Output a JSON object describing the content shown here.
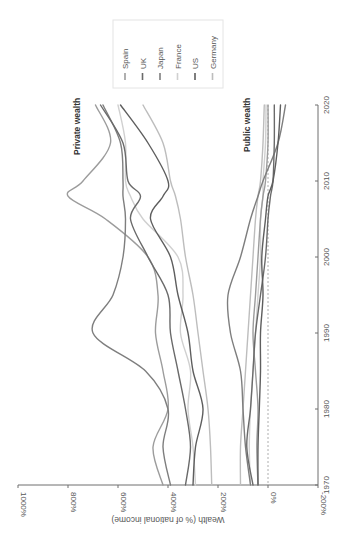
{
  "chart_data": {
    "type": "line",
    "orientation": "rotated-90-clockwise",
    "title": "",
    "xlabel": "",
    "ylabel": "Wealth (% of national income)",
    "x_ticks": [
      "1970",
      "1980",
      "1990",
      "2000",
      "2010",
      "2020"
    ],
    "y_ticks": [
      "-200%",
      "0%",
      "200%",
      "400%",
      "600%",
      "800%",
      "1000%"
    ],
    "xlim": [
      1970,
      2020
    ],
    "ylim": [
      -200,
      1000
    ],
    "grid": false,
    "zero_reference_line": "dashed",
    "legend_position": "top-right (rotated)",
    "annotations": [
      "Private wealth",
      "Public wealth"
    ],
    "x": [
      1970,
      1975,
      1980,
      1985,
      1990,
      1995,
      2000,
      2005,
      2008,
      2010,
      2015,
      2020
    ],
    "series": [
      {
        "name": "Spain",
        "group": "private",
        "color": "#9c9c9c",
        "values": [
          420,
          460,
          400,
          420,
          450,
          440,
          480,
          650,
          800,
          740,
          630,
          690
        ]
      },
      {
        "name": "UK",
        "group": "private",
        "color": "#6a6a6a",
        "values": [
          330,
          310,
          330,
          360,
          390,
          400,
          480,
          550,
          510,
          560,
          580,
          670
        ]
      },
      {
        "name": "Japan",
        "group": "private",
        "color": "#7e7e7e",
        "values": [
          390,
          420,
          400,
          490,
          700,
          620,
          580,
          570,
          580,
          580,
          590,
          660
        ]
      },
      {
        "name": "France",
        "group": "private",
        "color": "#d0d0d0",
        "values": [
          290,
          300,
          320,
          310,
          350,
          340,
          360,
          500,
          550,
          570,
          570,
          600
        ]
      },
      {
        "name": "US",
        "group": "private",
        "color": "#5e5e5e",
        "values": [
          300,
          290,
          260,
          300,
          320,
          360,
          390,
          470,
          420,
          400,
          480,
          590
        ]
      },
      {
        "name": "Germany",
        "group": "private",
        "color": "#bdbdbd",
        "values": [
          225,
          230,
          240,
          260,
          280,
          300,
          330,
          350,
          370,
          390,
          420,
          500
        ]
      },
      {
        "name": "Spain",
        "group": "public",
        "color": "#9c9c9c",
        "values": [
          40,
          45,
          40,
          50,
          60,
          50,
          40,
          30,
          20,
          10,
          0,
          0
        ]
      },
      {
        "name": "UK",
        "group": "public",
        "color": "#6a6a6a",
        "values": [
          60,
          85,
          70,
          60,
          50,
          30,
          10,
          0,
          -10,
          -20,
          -25,
          -25
        ]
      },
      {
        "name": "Japan",
        "group": "public",
        "color": "#7e7e7e",
        "values": [
          70,
          90,
          100,
          110,
          150,
          160,
          110,
          70,
          40,
          20,
          -40,
          -70
        ]
      },
      {
        "name": "France",
        "group": "public",
        "color": "#d0d0d0",
        "values": [
          70,
          75,
          70,
          60,
          50,
          40,
          30,
          30,
          20,
          20,
          10,
          8
        ]
      },
      {
        "name": "US",
        "group": "public",
        "color": "#5e5e5e",
        "values": [
          40,
          40,
          35,
          30,
          30,
          20,
          25,
          10,
          0,
          -20,
          -40,
          -50
        ]
      },
      {
        "name": "Germany",
        "group": "public",
        "color": "#bdbdbd",
        "values": [
          110,
          110,
          100,
          90,
          80,
          70,
          60,
          50,
          40,
          30,
          20,
          15
        ]
      }
    ]
  },
  "legend": {
    "items": [
      {
        "label": "Spain",
        "color": "#9c9c9c"
      },
      {
        "label": "UK",
        "color": "#6a6a6a"
      },
      {
        "label": "Japan",
        "color": "#7e7e7e"
      },
      {
        "label": "France",
        "color": "#d0d0d0"
      },
      {
        "label": "US",
        "color": "#5e5e5e"
      },
      {
        "label": "Germany",
        "color": "#bdbdbd"
      }
    ]
  },
  "annotations": {
    "private": "Private wealth",
    "public": "Public wealth"
  },
  "axes": {
    "value_title": "Wealth (% of national income)"
  }
}
